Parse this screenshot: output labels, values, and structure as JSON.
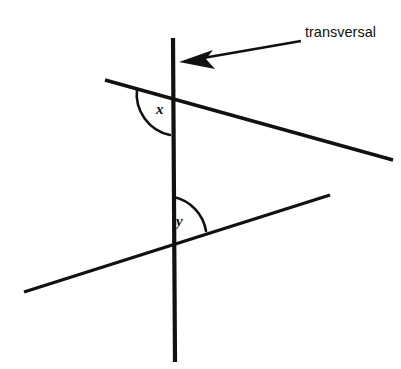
{
  "figure": {
    "background_color": "#ffffff",
    "stroke_color": "#111111",
    "width": 401,
    "height": 369
  },
  "labels": {
    "callout": "transversal",
    "angle_upper": "x",
    "angle_lower": "y"
  },
  "geometry": {
    "transversal": {
      "name": "transversal",
      "x1": 173,
      "y1": 38,
      "x2": 175,
      "y2": 362,
      "orientation": "vertical"
    },
    "line_upper": {
      "name": "upper-crossed-line",
      "x1": 105,
      "y1": 80,
      "x2": 393,
      "y2": 160,
      "orientation": "slopes-down-to-right"
    },
    "line_lower": {
      "name": "lower-crossed-line",
      "x1": 24,
      "y1": 292,
      "x2": 330,
      "y2": 195,
      "orientation": "slopes-up-to-right"
    },
    "intersection_upper": {
      "x": 173,
      "y": 100
    },
    "intersection_lower": {
      "x": 174,
      "y": 238
    },
    "arc_upper": {
      "name": "angle-x-arc",
      "path": "M 137 89 A 40 40 0 0 0 168 134",
      "side": "left-below-upper-line"
    },
    "arc_lower": {
      "name": "angle-y-arc",
      "path": "M 174 198 A 40 40 0 0 1 205 229",
      "side": "right-above-lower-line"
    }
  },
  "pointer": {
    "name": "transversal-callout-arrow",
    "shaft": {
      "x1": 300,
      "y1": 42,
      "x2": 200,
      "y2": 59
    },
    "tip": {
      "x": 180,
      "y": 62
    },
    "head_path": "M 180 62 L 211 51 L 205 60 L 214 68 Z"
  },
  "label_positions": {
    "callout": {
      "x": 305,
      "y": 37
    },
    "angle_upper": {
      "x": 156,
      "y": 114
    },
    "angle_lower": {
      "x": 176,
      "y": 226
    }
  }
}
